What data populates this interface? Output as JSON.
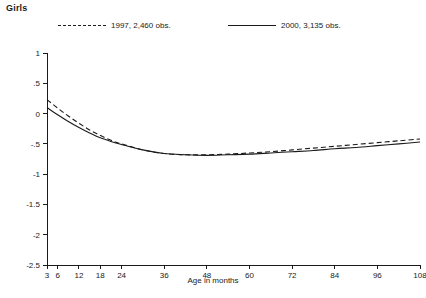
{
  "chart_data": {
    "type": "line",
    "title": "Girls",
    "xlabel": "Age in months",
    "ylabel": "",
    "xlim": [
      3,
      108
    ],
    "ylim": [
      -2.5,
      1
    ],
    "grid": false,
    "legend_position": "top",
    "xticks": [
      3,
      6,
      12,
      18,
      24,
      36,
      48,
      60,
      72,
      84,
      96,
      108
    ],
    "xtick_labels": [
      "3",
      "6",
      "12",
      "18",
      "24",
      "36",
      "48",
      "60",
      "72",
      "84",
      "96",
      "108"
    ],
    "yticks": [
      1,
      0.5,
      0,
      -0.5,
      -1,
      -1.5,
      -2,
      -2.5
    ],
    "ytick_labels": [
      "1",
      ".5",
      "0",
      "-.5",
      "-1",
      "-1.5",
      "-2",
      "-2.5"
    ],
    "x": [
      3,
      6,
      9,
      12,
      15,
      18,
      21,
      24,
      30,
      36,
      42,
      48,
      54,
      60,
      66,
      72,
      78,
      84,
      90,
      96,
      102,
      108
    ],
    "series": [
      {
        "name": "1997, 2,460 obs.",
        "style": "dashed",
        "color": "#1a1a1a",
        "values": [
          0.23,
          0.09,
          -0.04,
          -0.16,
          -0.27,
          -0.36,
          -0.44,
          -0.5,
          -0.6,
          -0.66,
          -0.68,
          -0.68,
          -0.67,
          -0.65,
          -0.63,
          -0.6,
          -0.57,
          -0.54,
          -0.51,
          -0.48,
          -0.45,
          -0.42
        ]
      },
      {
        "name": "2000, 3,135 obs.",
        "style": "solid",
        "color": "#1a1a1a",
        "values": [
          0.1,
          -0.02,
          -0.13,
          -0.23,
          -0.32,
          -0.4,
          -0.46,
          -0.51,
          -0.6,
          -0.66,
          -0.68,
          -0.69,
          -0.68,
          -0.67,
          -0.65,
          -0.63,
          -0.61,
          -0.58,
          -0.56,
          -0.53,
          -0.5,
          -0.47
        ]
      }
    ]
  },
  "legend": {
    "entries": [
      {
        "label": "1997, 2,460 obs.",
        "style": "dashed"
      },
      {
        "label": "2000, 3,135 obs.",
        "style": "solid"
      }
    ]
  }
}
